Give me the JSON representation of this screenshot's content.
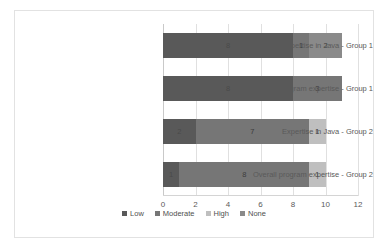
{
  "chart_data": {
    "type": "bar",
    "orientation": "horizontal",
    "stacked": true,
    "title": "",
    "xlabel": "",
    "ylabel": "",
    "xlim": [
      0,
      12
    ],
    "xticks": [
      0,
      2,
      4,
      6,
      8,
      10,
      12
    ],
    "xtick_labels": [
      "0",
      "2",
      "4",
      "6",
      "8",
      "10",
      "12"
    ],
    "grid": true,
    "legend_position": "bottom-center",
    "categories": [
      "Expertise in Java - Group 1",
      "Overall program expertise - Group 1",
      "Expertise in Java - Group 2",
      "Overall program expertise - Group 2"
    ],
    "series": [
      {
        "name": "Low",
        "color": "#595959",
        "values": [
          8,
          8,
          2,
          1
        ]
      },
      {
        "name": "Moderate",
        "color": "#767676",
        "values": [
          1,
          3,
          7,
          8
        ]
      },
      {
        "name": "High",
        "color": "#bfbfbf",
        "values": [
          0,
          0,
          1,
          1
        ]
      },
      {
        "name": "None",
        "color": "#8a8a8a",
        "values": [
          2,
          0,
          0,
          0
        ]
      }
    ],
    "totals": [
      11,
      11,
      10,
      10
    ],
    "bars": [
      {
        "category": "Expertise in Java - Group 1",
        "segments": [
          {
            "series": "Low",
            "value": 8,
            "label": "8"
          },
          {
            "series": "Moderate",
            "value": 1,
            "label": "1"
          },
          {
            "series": "None",
            "value": 2,
            "label": "2"
          }
        ]
      },
      {
        "category": "Overall program expertise - Group 1",
        "segments": [
          {
            "series": "Low",
            "value": 8,
            "label": "8"
          },
          {
            "series": "Moderate",
            "value": 3,
            "label": "3"
          }
        ]
      },
      {
        "category": "Expertise in Java - Group 2",
        "segments": [
          {
            "series": "Low",
            "value": 2,
            "label": "2"
          },
          {
            "series": "Moderate",
            "value": 7,
            "label": "7"
          },
          {
            "series": "High",
            "value": 1,
            "label": "1"
          }
        ]
      },
      {
        "category": "Overall program expertise - Group 2",
        "segments": [
          {
            "series": "Low",
            "value": 1,
            "label": "1"
          },
          {
            "series": "Moderate",
            "value": 8,
            "label": "8"
          },
          {
            "series": "High",
            "value": 1,
            "label": "1"
          }
        ]
      }
    ],
    "legend": [
      {
        "label": "Low",
        "color": "#595959"
      },
      {
        "label": "Moderate",
        "color": "#767676"
      },
      {
        "label": "High",
        "color": "#bfbfbf"
      },
      {
        "label": "None",
        "color": "#8a8a8a"
      }
    ]
  }
}
